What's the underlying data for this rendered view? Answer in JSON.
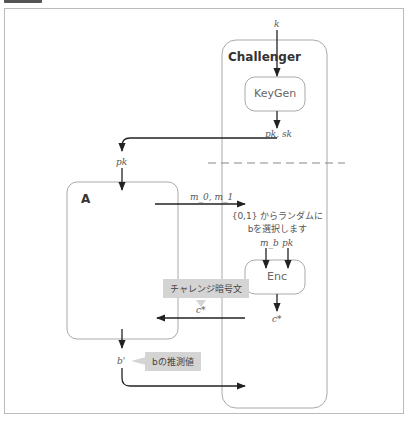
{
  "header": {
    "tag_label": "",
    "caption": ""
  },
  "challenger": {
    "title": "Challenger",
    "keygen_label": "KeyGen",
    "enc_label": "Enc",
    "input_k": "k",
    "keygen_output": "pk, sk",
    "random_choice_line1": "{0,1} からランダムに",
    "random_choice_line2": "bを選択します",
    "enc_input_m": "m_b",
    "enc_input_pk": "pk",
    "enc_output": "c*"
  },
  "adversary": {
    "title": "A",
    "input_pk": "pk",
    "output_messages": "m_0, m_1",
    "received_ciphertext": "c*",
    "output_guess": "b'"
  },
  "callouts": {
    "challenge_ciphertext": "チャレンジ暗号文",
    "guess_of_b": "bの推測値"
  },
  "colors": {
    "arrow": "#222222",
    "box_border": "#aaaaaa",
    "callout_bg": "#d4d4d4",
    "dashed_line": "#888888"
  }
}
